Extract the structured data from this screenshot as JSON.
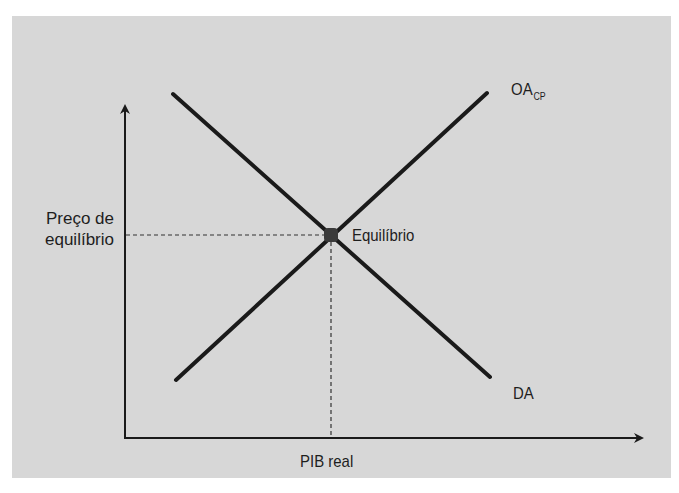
{
  "diagram": {
    "type": "AD-AS equilibrium diagram",
    "background_color": "#d7d7d7",
    "line_color": "#1a1a1a",
    "x_axis_label": "PIB real",
    "y_axis_label_line1": "Preço de",
    "y_axis_label_line2": "equilíbrio",
    "curves": {
      "supply": {
        "label": "OA",
        "subscript": "CP",
        "from": [
          176,
          380
        ],
        "to": [
          487,
          93
        ]
      },
      "demand": {
        "label": "DA",
        "from": [
          173,
          94
        ],
        "to": [
          490,
          377
        ]
      }
    },
    "equilibrium": {
      "label": "Equilíbrio",
      "point": [
        331,
        235
      ]
    },
    "axes": {
      "origin": [
        125,
        438
      ],
      "y_top": [
        125,
        104
      ],
      "x_right": [
        644,
        438
      ]
    }
  }
}
